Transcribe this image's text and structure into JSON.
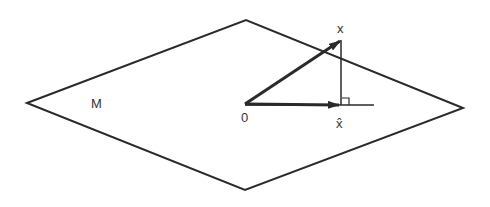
{
  "diagram": {
    "colors": {
      "stroke": "#2a2a2a",
      "text": "#333333",
      "background": "#ffffff"
    },
    "plane": {
      "label": "M",
      "vertices": {
        "left": [
          27,
          103
        ],
        "top": [
          246,
          20
        ],
        "right": [
          463,
          108
        ],
        "bottom": [
          245,
          190
        ]
      }
    },
    "origin": {
      "label": "0",
      "point": [
        245,
        104
      ]
    },
    "vector_x": {
      "label": "x",
      "tip": [
        341,
        40
      ]
    },
    "vector_xhat": {
      "label": "x̂",
      "tip": [
        340,
        105
      ]
    },
    "projection_line": {
      "from": [
        245,
        105
      ],
      "to": [
        374,
        105
      ]
    },
    "perpendicular": {
      "from": [
        341,
        40
      ],
      "to": [
        341,
        105
      ],
      "right_angle_marker": true
    }
  }
}
